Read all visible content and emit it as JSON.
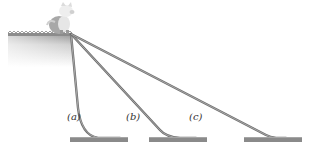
{
  "figure": {
    "labels": {
      "a": "(a)",
      "b": "(b)",
      "c": "(c)"
    },
    "colors": {
      "slide": "#6e6e6e",
      "ground": "#8a8a8a",
      "ledge_top": "#8c8c8c",
      "ledge_fill": "#d9d9d9",
      "pig": "#c8c8c8"
    }
  }
}
